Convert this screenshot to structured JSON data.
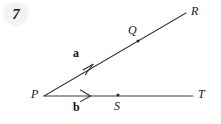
{
  "figure": {
    "question_number": "7",
    "background_color": "#ffffff",
    "stroke_color": "#333333",
    "label_color": "#161616",
    "badge_color": "#f2f2f2",
    "width": 221,
    "height": 124,
    "vertex": {
      "name": "P",
      "x": 44,
      "y": 96
    },
    "rays": [
      {
        "id": "ray-PR",
        "from": "P",
        "to": "R",
        "x1": 44,
        "y1": 96,
        "x2": 186,
        "y2": 13,
        "endpoint_label": "R",
        "vector_label": "a",
        "arrow_tip_x": 92,
        "arrow_tip_y": 68,
        "marked_point": "Q"
      },
      {
        "id": "ray-PT",
        "from": "P",
        "to": "T",
        "x1": 44,
        "y1": 96,
        "x2": 193,
        "y2": 96,
        "endpoint_label": "T",
        "vector_label": "b",
        "arrow_tip_x": 90,
        "arrow_tip_y": 96,
        "marked_point": "S"
      }
    ],
    "points": [
      {
        "name": "P",
        "x": 44,
        "y": 96,
        "dot": false,
        "label_position": "left"
      },
      {
        "name": "Q",
        "x": 138,
        "y": 41,
        "dot": true,
        "label_position": "above-left"
      },
      {
        "name": "R",
        "x": 186,
        "y": 13,
        "dot": false,
        "label_position": "above-right"
      },
      {
        "name": "S",
        "x": 118,
        "y": 95,
        "dot": true,
        "label_position": "below"
      },
      {
        "name": "T",
        "x": 193,
        "y": 96,
        "dot": false,
        "label_position": "right"
      }
    ],
    "labels": {
      "P": "P",
      "Q": "Q",
      "R": "R",
      "S": "S",
      "T": "T",
      "vector_a": "a",
      "vector_b": "b"
    }
  }
}
